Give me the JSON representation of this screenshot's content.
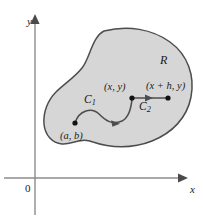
{
  "figure": {
    "background_color": "#ffffff"
  },
  "axes": {
    "x_label": "x",
    "y_label": "y",
    "origin_label": "0",
    "axis_color": "#8c8c8c",
    "x_axis_y": 178,
    "y_axis_x": 35
  },
  "region": {
    "label": "R",
    "fill_color": "#d6d6d6",
    "stroke_color": "#4d4d4d"
  },
  "points": {
    "start": "(a, b)",
    "middle": "(x, y)",
    "end": "(x + h, y)",
    "dot_color": "#111111"
  },
  "curves": {
    "c1_label": "C",
    "c1_sub": "1",
    "c2_label": "C",
    "c2_sub": "2",
    "curve_color": "#4d4d4d"
  }
}
